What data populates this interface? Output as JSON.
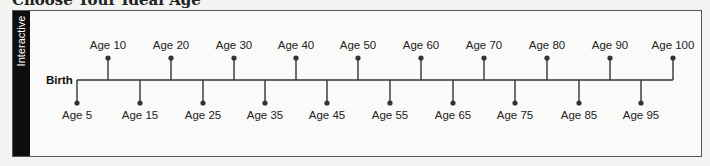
{
  "title": "Choose Your Ideal Age",
  "sidebar": {
    "label": "Interactive"
  },
  "timeline": {
    "start_label": "Birth",
    "line_color": "#333333",
    "upper": [
      {
        "label": "Age 10",
        "x": 108
      },
      {
        "label": "Age 20",
        "x": 171
      },
      {
        "label": "Age 30",
        "x": 234
      },
      {
        "label": "Age 40",
        "x": 296
      },
      {
        "label": "Age 50",
        "x": 358
      },
      {
        "label": "Age 60",
        "x": 421
      },
      {
        "label": "Age 70",
        "x": 484
      },
      {
        "label": "Age 80",
        "x": 547
      },
      {
        "label": "Age 90",
        "x": 610
      },
      {
        "label": "Age 100",
        "x": 673
      }
    ],
    "lower": [
      {
        "label": "Age 5",
        "x": 77
      },
      {
        "label": "Age 15",
        "x": 140
      },
      {
        "label": "Age 25",
        "x": 203
      },
      {
        "label": "Age 35",
        "x": 265
      },
      {
        "label": "Age 45",
        "x": 327
      },
      {
        "label": "Age 55",
        "x": 390
      },
      {
        "label": "Age 65",
        "x": 453
      },
      {
        "label": "Age 75",
        "x": 515
      },
      {
        "label": "Age 85",
        "x": 579
      },
      {
        "label": "Age 95",
        "x": 641
      }
    ]
  }
}
